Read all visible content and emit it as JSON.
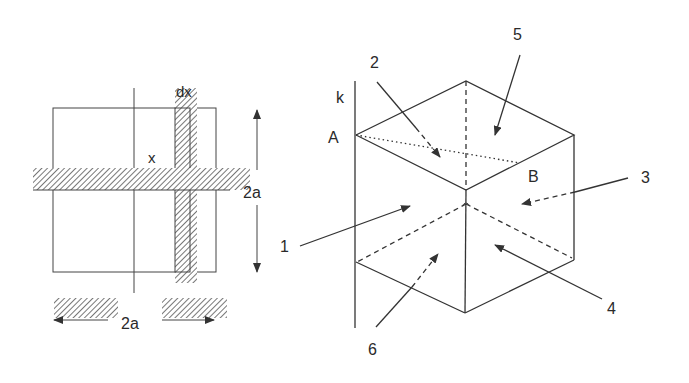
{
  "left_figure": {
    "labels": {
      "dx": "dx",
      "x": "x",
      "side_vertical": "2a",
      "side_horizontal": "2a"
    }
  },
  "right_figure": {
    "labels": {
      "axis": "k",
      "vertex_a": "A",
      "vertex_b": "B",
      "face_1": "1",
      "face_2": "2",
      "face_3": "3",
      "face_4": "4",
      "face_5": "5",
      "face_6": "6"
    }
  },
  "colors": {
    "ink": "#333333",
    "background": "#ffffff"
  }
}
